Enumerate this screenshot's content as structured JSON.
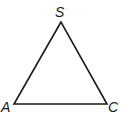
{
  "diagram": {
    "type": "triangle",
    "vertices": [
      {
        "name": "S",
        "label": "S",
        "x": 61,
        "y": 22
      },
      {
        "name": "A",
        "label": "A",
        "x": 14,
        "y": 104
      },
      {
        "name": "C",
        "label": "C",
        "x": 107,
        "y": 104
      }
    ],
    "stroke_color": "#1a1a1a"
  }
}
